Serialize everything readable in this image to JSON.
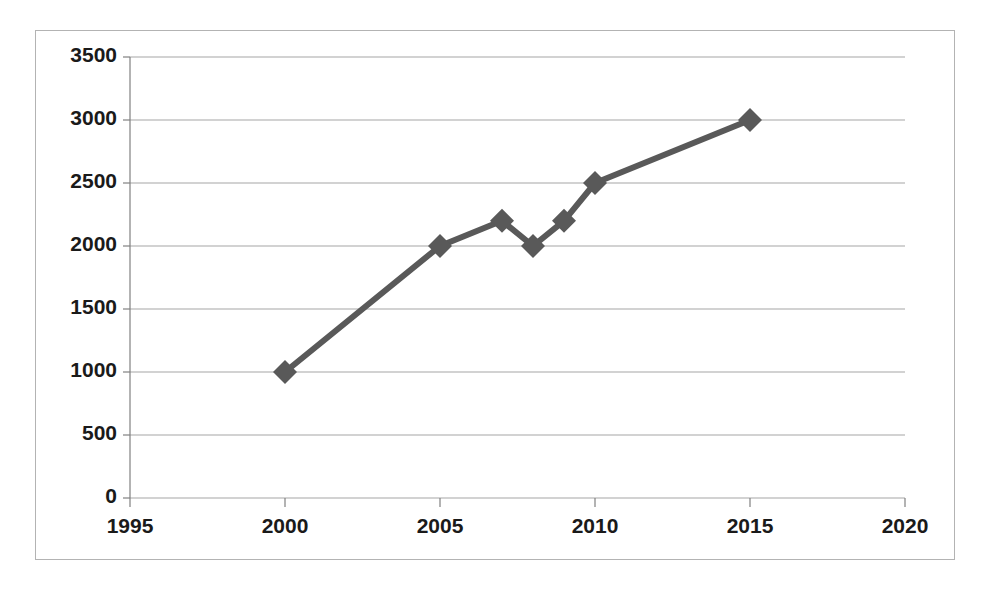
{
  "chart_data": {
    "type": "line",
    "title": "",
    "subtitle": "",
    "xlabel": "",
    "ylabel": "",
    "x": [
      2000,
      2005,
      2007,
      2008,
      2009,
      2010,
      2015
    ],
    "values": [
      1000,
      2000,
      2200,
      2000,
      2200,
      2500,
      3000
    ],
    "series": [
      {
        "name": "",
        "x": [
          2000,
          2005,
          2007,
          2008,
          2009,
          2010,
          2015
        ],
        "values": [
          1000,
          2000,
          2200,
          2000,
          2200,
          2500,
          3000
        ]
      }
    ],
    "xlim": [
      1995,
      2020
    ],
    "ylim": [
      0,
      3500
    ],
    "xticks": [
      1995,
      2000,
      2005,
      2010,
      2015,
      2020
    ],
    "xtick_labels": [
      "1995",
      "2000",
      "2005",
      "2010",
      "2015",
      "2020"
    ],
    "yticks": [
      0,
      500,
      1000,
      1500,
      2000,
      2500,
      3000,
      3500
    ],
    "ytick_labels": [
      "0",
      "500",
      "1000",
      "1500",
      "2000",
      "2500",
      "3000",
      "3500"
    ],
    "grid": "horizontal",
    "legend": "none",
    "marker": "diamond",
    "annotations": []
  },
  "style": {
    "series_color": "#595959",
    "gridline_color": "#a6a6a6",
    "axis_color": "#808080",
    "frame_color": "#b3b3b3",
    "tick_label_color": "#1a1a1a",
    "plot_background": "#ffffff"
  }
}
